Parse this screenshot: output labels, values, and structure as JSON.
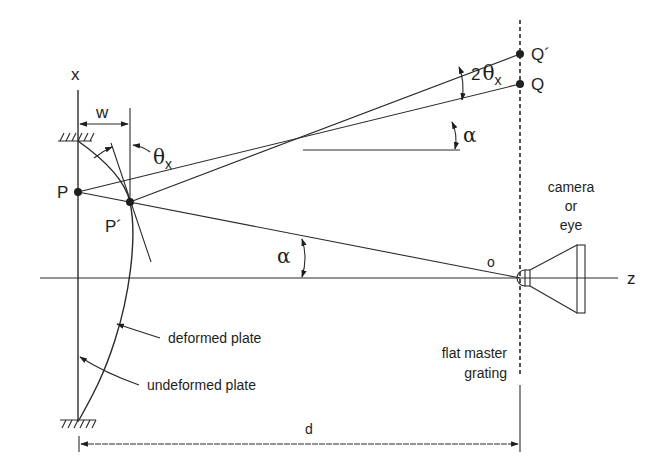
{
  "diagram": {
    "type": "optical shadow-moire / reflection-moire setup",
    "axes": {
      "x_label": "x",
      "z_label": "z"
    },
    "points": {
      "P": "P",
      "P_prime": "P´",
      "Q": "Q",
      "Q_prime": "Q´",
      "origin": "o"
    },
    "dimensions": {
      "deflection": "w",
      "distance": "d"
    },
    "angles": {
      "slope": "θ",
      "slope_sub": "x",
      "alpha_lower": "α",
      "alpha_upper": "α",
      "double_slope_coef": "2",
      "double_slope": "θ",
      "double_slope_sub": "x"
    },
    "labels": {
      "camera_line1": "camera",
      "camera_line2": "or",
      "camera_line3": "eye",
      "deformed_plate": "deformed  plate",
      "undeformed_plate": "undeformed  plate",
      "grating_line1": "flat  master",
      "grating_line2": "grating"
    },
    "colors": {
      "ink": "#1e1e1e",
      "background": "#ffffff"
    }
  }
}
